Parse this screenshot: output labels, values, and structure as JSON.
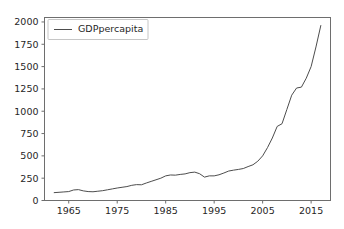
{
  "figure": {
    "background_color": "#ffffff",
    "axes_background_color": "#ffffff",
    "spine_color": "#6e6e6e",
    "tick_label_color": "#262626"
  },
  "legend": {
    "entries": [
      {
        "label": "GDPpercapita",
        "color": "#4d4d4d"
      }
    ],
    "position": "upper left",
    "frame_color": "#b8b8b8"
  },
  "chart_data": {
    "type": "line",
    "title": "",
    "xlabel": "",
    "ylabel": "",
    "xlim": [
      1960,
      2019
    ],
    "ylim": [
      0,
      2050
    ],
    "xticks": [
      1965,
      1975,
      1985,
      1995,
      2005,
      2015
    ],
    "yticks": [
      0,
      250,
      500,
      750,
      1000,
      1250,
      1500,
      1750,
      2000
    ],
    "xtick_labels": [
      "1965",
      "1975",
      "1985",
      "1995",
      "2005",
      "2015"
    ],
    "ytick_labels": [
      "0",
      "250",
      "500",
      "750",
      "1000",
      "1250",
      "1500",
      "1750",
      "2000"
    ],
    "grid": false,
    "legend_position": "upper left",
    "series": [
      {
        "name": "GDPpercapita",
        "color": "#4d4d4d",
        "linewidth": 1,
        "x": [
          1962,
          1963,
          1964,
          1965,
          1966,
          1967,
          1968,
          1969,
          1970,
          1971,
          1972,
          1973,
          1974,
          1975,
          1976,
          1977,
          1978,
          1979,
          1980,
          1981,
          1982,
          1983,
          1984,
          1985,
          1986,
          1987,
          1988,
          1989,
          1990,
          1991,
          1992,
          1993,
          1994,
          1995,
          1996,
          1997,
          1998,
          1999,
          2000,
          2001,
          2002,
          2003,
          2004,
          2005,
          2006,
          2007,
          2008,
          2009,
          2010,
          2011,
          2012,
          2013,
          2014,
          2015,
          2016,
          2017
        ],
        "y": [
          88,
          92,
          96,
          100,
          118,
          122,
          108,
          100,
          98,
          104,
          110,
          120,
          130,
          140,
          148,
          156,
          170,
          178,
          176,
          196,
          214,
          232,
          250,
          276,
          286,
          284,
          292,
          298,
          312,
          318,
          300,
          262,
          276,
          276,
          288,
          308,
          330,
          340,
          348,
          358,
          380,
          400,
          440,
          500,
          592,
          700,
          830,
          860,
          1020,
          1180,
          1260,
          1270,
          1370,
          1500,
          1720,
          1960
        ]
      }
    ]
  }
}
